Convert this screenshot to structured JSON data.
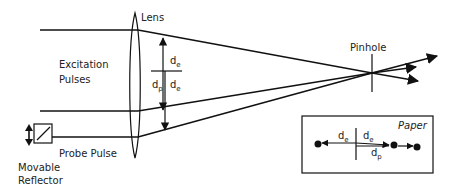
{
  "diagram": {
    "labels": {
      "lens": "Lens",
      "excitation_line1": "Excitation",
      "excitation_line2": "Pulses",
      "pinhole": "Pinhole",
      "probe_pulse": "Probe Pulse",
      "reflector_line1": "Movable",
      "reflector_line2": "Reflector",
      "paper": "Paper"
    },
    "distances": {
      "d_e_base": "d",
      "d_e_sub": "e",
      "d_p_base": "d",
      "d_p_sub": "p"
    },
    "components": [
      "Lens",
      "Excitation Pulses",
      "Pinhole",
      "Probe Pulse",
      "Movable Reflector",
      "Paper"
    ],
    "colors": {
      "line": "#111111",
      "text": "#222222",
      "background": "#ffffff"
    }
  }
}
